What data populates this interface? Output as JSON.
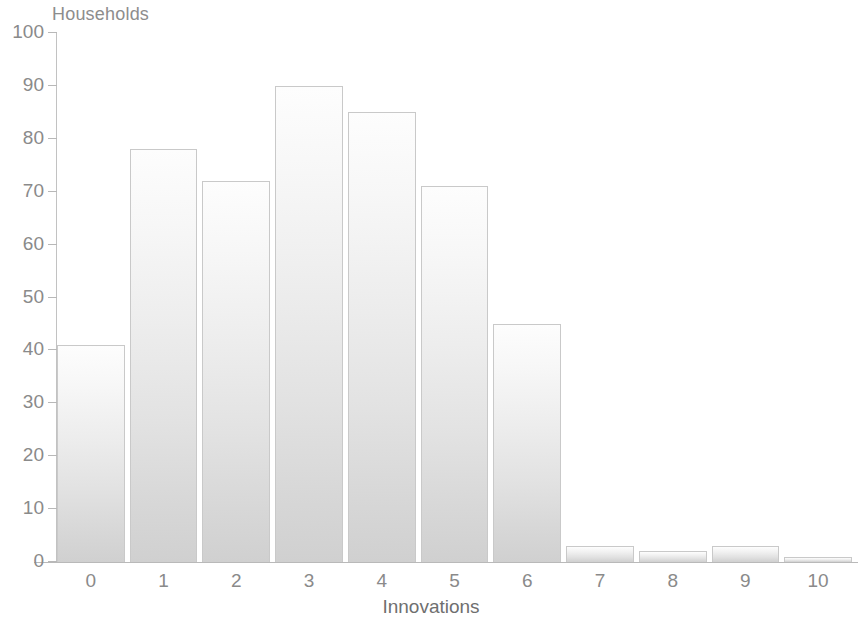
{
  "chart_data": {
    "type": "bar",
    "title": "",
    "subtitle": "",
    "xlabel": "Innovations",
    "ylabel": "Households",
    "categories": [
      "0",
      "1",
      "2",
      "3",
      "4",
      "5",
      "6",
      "7",
      "8",
      "9",
      "10"
    ],
    "values": [
      41,
      78,
      72,
      90,
      85,
      71,
      45,
      3,
      2,
      3,
      1
    ],
    "ylim": [
      0,
      100
    ],
    "yticks": [
      "0",
      "10",
      "20",
      "30",
      "40",
      "50",
      "60",
      "70",
      "80",
      "90",
      "100"
    ],
    "ytick_values": [
      0,
      10,
      20,
      30,
      40,
      50,
      60,
      70,
      80,
      90,
      100
    ],
    "grid": false,
    "legend": null,
    "legend_position": "none",
    "series": [
      {
        "name": "Households",
        "values": [
          41,
          78,
          72,
          90,
          85,
          71,
          45,
          3,
          2,
          3,
          1
        ]
      }
    ],
    "colors": {
      "bar_fill_top": "#fdfdfd",
      "bar_fill_bottom": "#d0d0d0",
      "bar_outline": "#c9c9c9",
      "axis": "#b8b8b8",
      "tick_text": "#8a8a8a",
      "axis_title": "#6f6f6f",
      "background": "#ffffff"
    }
  }
}
